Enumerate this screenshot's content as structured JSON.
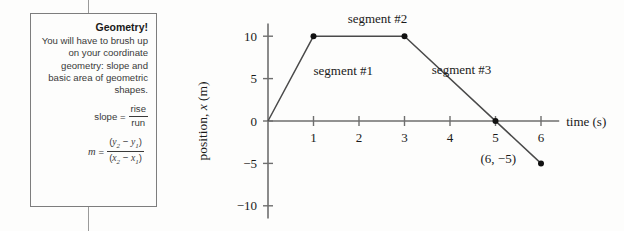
{
  "sidebar": {
    "title": "Geometry!",
    "body": "You will have to brush up on your coordinate geometry: slope and basic area of geometric shapes.",
    "formula_slope": {
      "lhs": "slope =",
      "numerator": "rise",
      "denominator": "run"
    },
    "formula_m": {
      "lhs": "m",
      "equals": "=",
      "numerator_open": "(",
      "numerator_y2": "y",
      "numerator_y2_sub": "2",
      "numerator_minus": " − ",
      "numerator_y1": "y",
      "numerator_y1_sub": "1",
      "numerator_close": ")",
      "denominator_open": "(",
      "denominator_x2": "x",
      "denominator_x2_sub": "2",
      "denominator_minus": " − ",
      "denominator_x1": "x",
      "denominator_x1_sub": "1",
      "denominator_close": ")"
    }
  },
  "chart_data": {
    "type": "line",
    "title": "",
    "xlabel": "time (s)",
    "ylabel": "position, x (m)",
    "x": [
      0,
      1,
      3,
      6
    ],
    "values": [
      0,
      10,
      10,
      -5
    ],
    "xlim": [
      0,
      6.4
    ],
    "ylim": [
      -11.5,
      11.5
    ],
    "xticks": [
      1,
      2,
      3,
      4,
      5,
      6
    ],
    "xticklabels": [
      "1",
      "2",
      "3",
      "4",
      "5",
      "6"
    ],
    "yticks": [
      10,
      5,
      0,
      -5,
      -10
    ],
    "yticklabels": [
      "10",
      "5",
      "0",
      "−5",
      "−10"
    ],
    "grid": false,
    "legend": "none",
    "markers": [
      {
        "x": 1,
        "y": 10
      },
      {
        "x": 3,
        "y": 10
      },
      {
        "x": 5,
        "y": 0
      },
      {
        "x": 6,
        "y": -5
      }
    ],
    "annotations": [
      {
        "text": "segment #1",
        "x": 1.0,
        "y": 5.4
      },
      {
        "text": "segment #2",
        "x": 1.75,
        "y": 11.5
      },
      {
        "text": "segment #3",
        "x": 3.6,
        "y": 5.5
      },
      {
        "text": "(6, −5)",
        "x": 5.45,
        "y": -5.0
      }
    ],
    "series_label": "position vs time",
    "axis_color": "#6e6e6e",
    "line_color": "#4a4a4a",
    "marker_color": "#111111",
    "text_color": "#1a1a1a"
  }
}
